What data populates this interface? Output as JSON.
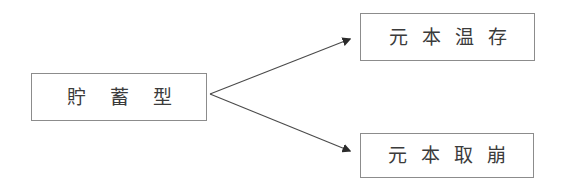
{
  "diagram": {
    "type": "branching-tree",
    "background_color": "#ffffff",
    "border_color": "#8c8c8c",
    "text_color": "#3b3b3b",
    "connector_color": "#4a4a4a",
    "root": {
      "id": "savings-type",
      "label": "貯蓄型"
    },
    "branches": [
      {
        "id": "principal-preservation",
        "label": "元本温存",
        "arrow_direction": "up-right",
        "arrowhead": "filled-triangle"
      },
      {
        "id": "principal-drawdown",
        "label": "元本取崩",
        "arrow_direction": "down-right",
        "arrowhead": "filled-triangle"
      }
    ]
  }
}
